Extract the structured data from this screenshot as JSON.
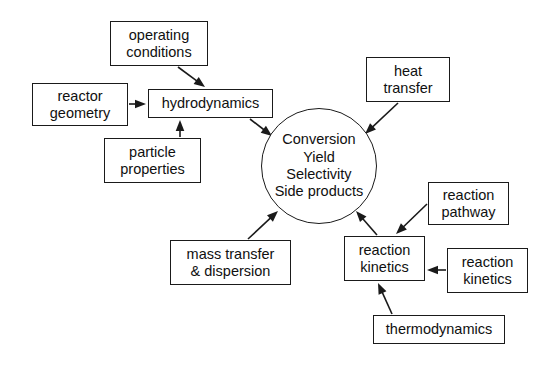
{
  "diagram": {
    "stroke_color": "#1a1a1a",
    "text_color": "#101010",
    "background_color": "#ffffff",
    "hub": {
      "label": "Conversion\nYield\nSelectivity\nSide products",
      "cx": 319,
      "cy": 166,
      "r": 58
    },
    "nodes": [
      {
        "id": "operating_conditions",
        "label": "operating\nconditions",
        "x": 110,
        "y": 21,
        "w": 98,
        "h": 45
      },
      {
        "id": "reactor_geometry",
        "label": "reactor\ngeometry",
        "x": 32,
        "y": 83,
        "w": 96,
        "h": 43
      },
      {
        "id": "hydrodynamics",
        "label": "hydrodynamics",
        "x": 148,
        "y": 89,
        "w": 125,
        "h": 29
      },
      {
        "id": "particle_properties",
        "label": "particle\nproperties",
        "x": 104,
        "y": 138,
        "w": 97,
        "h": 45
      },
      {
        "id": "heat_transfer",
        "label": "heat\ntransfer",
        "x": 366,
        "y": 57,
        "w": 84,
        "h": 45
      },
      {
        "id": "mass_transfer",
        "label": "mass transfer\n& dispersion",
        "x": 170,
        "y": 240,
        "w": 121,
        "h": 45
      },
      {
        "id": "reaction_pathway",
        "label": "reaction\npathway",
        "x": 428,
        "y": 182,
        "w": 81,
        "h": 43
      },
      {
        "id": "reaction_kinetics_main",
        "label": "reaction\nkinetics",
        "x": 344,
        "y": 236,
        "w": 81,
        "h": 45
      },
      {
        "id": "reaction_kinetics_right",
        "label": "reaction\nkinetics",
        "x": 447,
        "y": 248,
        "w": 81,
        "h": 45
      },
      {
        "id": "thermodynamics",
        "label": "thermodynamics",
        "x": 373,
        "y": 315,
        "w": 132,
        "h": 29
      }
    ],
    "edges": [
      {
        "id": "operating-to-hydrodynamics",
        "from": "operating_conditions",
        "to": "hydrodynamics",
        "x1": 178,
        "y1": 67,
        "x2": 205,
        "y2": 87
      },
      {
        "id": "reactor-to-hydrodynamics",
        "from": "reactor_geometry",
        "to": "hydrodynamics",
        "x1": 129,
        "y1": 104,
        "x2": 146,
        "y2": 104
      },
      {
        "id": "particle-to-hydrodynamics",
        "from": "particle_properties",
        "to": "hydrodynamics",
        "x1": 180,
        "y1": 137,
        "x2": 180,
        "y2": 120
      },
      {
        "id": "hydrodynamics-to-hub",
        "from": "hydrodynamics",
        "to": "hub",
        "x1": 250,
        "y1": 119,
        "x2": 272,
        "y2": 136
      },
      {
        "id": "heat-to-hub",
        "from": "heat_transfer",
        "to": "hub",
        "x1": 398,
        "y1": 103,
        "x2": 365,
        "y2": 134
      },
      {
        "id": "mass-to-hub",
        "from": "mass_transfer",
        "to": "hub",
        "x1": 248,
        "y1": 239,
        "x2": 278,
        "y2": 211
      },
      {
        "id": "kinetics-to-hub",
        "from": "reaction_kinetics_main",
        "to": "hub",
        "x1": 377,
        "y1": 235,
        "x2": 356,
        "y2": 211
      },
      {
        "id": "pathway-to-kinetics",
        "from": "reaction_pathway",
        "to": "reaction_kinetics_main",
        "x1": 427,
        "y1": 204,
        "x2": 396,
        "y2": 234
      },
      {
        "id": "kineticsright-to-kinetics",
        "from": "reaction_kinetics_right",
        "to": "reaction_kinetics_main",
        "x1": 446,
        "y1": 270,
        "x2": 427,
        "y2": 270
      },
      {
        "id": "thermo-to-kinetics",
        "from": "thermodynamics",
        "to": "reaction_kinetics_main",
        "x1": 392,
        "y1": 314,
        "x2": 378,
        "y2": 283
      }
    ]
  }
}
